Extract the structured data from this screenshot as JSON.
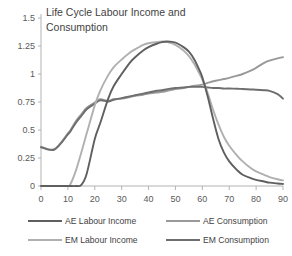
{
  "chart_data": {
    "type": "line",
    "title": "Life Cycle Labour Income and Consumption",
    "title_line1": "Life Cycle Labour Income and",
    "title_line2": "Consumption",
    "xlabel": "",
    "ylabel": "",
    "xlim": [
      0,
      90
    ],
    "ylim": [
      0,
      1.5
    ],
    "xticks": [
      0,
      10,
      20,
      30,
      40,
      50,
      60,
      70,
      80,
      90
    ],
    "xtick_labels": [
      "0",
      "10",
      "20",
      "30",
      "40",
      "50",
      "60",
      "70",
      "80",
      "90"
    ],
    "yticks": [
      0,
      0.25,
      0.5,
      0.75,
      1,
      1.25,
      1.5
    ],
    "ytick_labels": [
      "0",
      "0.25",
      "0.5",
      "0.75",
      "1",
      "1.25",
      "1.5"
    ],
    "grid": false,
    "legend_position": "bottom",
    "x": [
      0,
      5,
      10,
      11,
      13,
      15,
      17,
      20,
      22,
      25,
      27,
      30,
      33,
      35,
      38,
      40,
      43,
      45,
      47,
      50,
      53,
      55,
      57,
      59,
      60,
      62,
      64,
      66,
      68,
      70,
      73,
      75,
      78,
      80,
      83,
      85,
      88,
      90
    ],
    "series": [
      {
        "name": "AE Labour Income",
        "color": "#5f5f5f",
        "values": [
          0,
          0,
          0,
          0,
          0,
          0.01,
          0.11,
          0.42,
          0.56,
          0.78,
          0.89,
          1.0,
          1.1,
          1.15,
          1.21,
          1.24,
          1.27,
          1.285,
          1.29,
          1.28,
          1.24,
          1.2,
          1.13,
          1.03,
          0.97,
          0.8,
          0.6,
          0.42,
          0.3,
          0.22,
          0.14,
          0.1,
          0.07,
          0.055,
          0.04,
          0.03,
          0.022,
          0.018
        ]
      },
      {
        "name": "EM Labour Income",
        "color": "#b0b0b0",
        "values": [
          0,
          0,
          0,
          0.02,
          0.14,
          0.3,
          0.47,
          0.72,
          0.85,
          0.99,
          1.06,
          1.13,
          1.19,
          1.22,
          1.26,
          1.275,
          1.285,
          1.29,
          1.285,
          1.26,
          1.21,
          1.16,
          1.09,
          1.0,
          0.95,
          0.83,
          0.68,
          0.55,
          0.44,
          0.36,
          0.27,
          0.22,
          0.16,
          0.13,
          0.1,
          0.08,
          0.06,
          0.05
        ]
      },
      {
        "name": "AE Consumption",
        "color": "#999999",
        "values": [
          0.35,
          0.33,
          0.47,
          0.5,
          0.58,
          0.64,
          0.7,
          0.745,
          0.775,
          0.76,
          0.775,
          0.78,
          0.795,
          0.805,
          0.815,
          0.825,
          0.835,
          0.84,
          0.85,
          0.865,
          0.875,
          0.885,
          0.895,
          0.9,
          0.905,
          0.92,
          0.935,
          0.945,
          0.955,
          0.965,
          0.985,
          1.0,
          1.03,
          1.055,
          1.1,
          1.12,
          1.14,
          1.15
        ]
      },
      {
        "name": "EM Consumption",
        "color": "#6e6e6e",
        "values": [
          0.345,
          0.325,
          0.46,
          0.49,
          0.565,
          0.625,
          0.685,
          0.735,
          0.765,
          0.755,
          0.77,
          0.785,
          0.8,
          0.81,
          0.825,
          0.835,
          0.85,
          0.855,
          0.865,
          0.875,
          0.88,
          0.885,
          0.885,
          0.885,
          0.885,
          0.88,
          0.875,
          0.875,
          0.87,
          0.87,
          0.868,
          0.866,
          0.862,
          0.86,
          0.855,
          0.85,
          0.82,
          0.78
        ]
      }
    ]
  },
  "legend": {
    "entries": [
      {
        "label": "AE Labour Income",
        "color": "#5f5f5f"
      },
      {
        "label": "AE Consumption",
        "color": "#999999"
      },
      {
        "label": "EM Labour Income",
        "color": "#b0b0b0"
      },
      {
        "label": "EM Consumption",
        "color": "#6e6e6e"
      }
    ]
  },
  "colors": {
    "axis": "#b3b3b3",
    "text": "#3f3f3f",
    "background": "#ffffff"
  }
}
